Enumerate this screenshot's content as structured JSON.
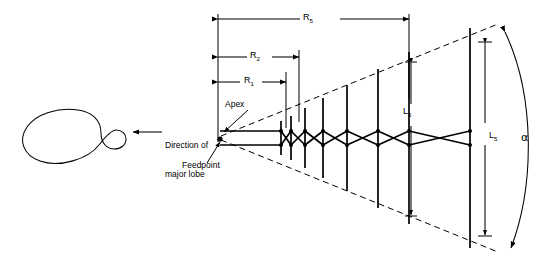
{
  "figure": {
    "type": "log-periodic-dipole-array-diagram",
    "background_color": "#ffffff",
    "line_color": "#000000"
  },
  "pattern": {
    "label_line1": "Direction of",
    "label_line2": "major lobe",
    "arrow_name": "major-lobe-direction-arrow"
  },
  "annotations": {
    "apex": "Apex",
    "feedpoint": "Feedpoint"
  },
  "dimensions": {
    "r1": {
      "symbol": "R",
      "subscript": "1"
    },
    "r2": {
      "symbol": "R",
      "subscript": "2"
    },
    "r5": {
      "symbol": "R",
      "subscript": "5"
    },
    "l5": {
      "symbol": "L",
      "subscript": "5"
    },
    "l6": {
      "symbol": "L",
      "subscript": "6"
    }
  },
  "angle": {
    "symbol": "α",
    "name": "apex-angle-alpha"
  }
}
